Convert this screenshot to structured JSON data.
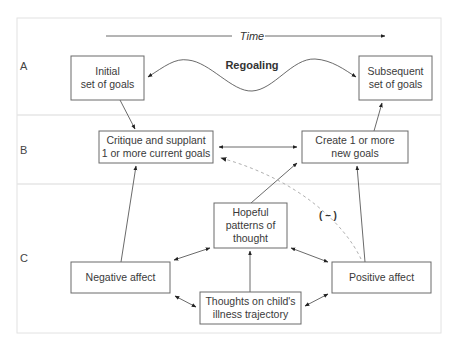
{
  "rows": {
    "a": "A",
    "b": "B",
    "c": "C"
  },
  "time_axis": {
    "label": "Time"
  },
  "regoaling": {
    "label": "Regoaling"
  },
  "boxes": {
    "initial": {
      "line1": "Initial",
      "line2": "set of goals"
    },
    "subsequent": {
      "line1": "Subsequent",
      "line2": "set of goals"
    },
    "critique": {
      "line1": "Critique and supplant",
      "line2": "1 or more current goals"
    },
    "create": {
      "line1": "Create 1 or more",
      "line2": "new goals"
    },
    "hopeful": {
      "line1": "Hopeful",
      "line2": "patterns of",
      "line3": "thought"
    },
    "negative": {
      "line1": "Negative affect"
    },
    "positive": {
      "line1": "Positive affect"
    },
    "thoughts": {
      "line1": "Thoughts on child's",
      "line2": "illness trajectory"
    }
  },
  "negative_link": {
    "label": "( – )"
  },
  "colors": {
    "box_stroke": "#6a6a6a",
    "arrow": "#444444",
    "dashed": "#b0b0b0",
    "frame": "#e2e2e2"
  }
}
